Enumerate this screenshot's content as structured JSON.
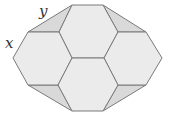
{
  "labels": {
    "x": "x",
    "y": "y"
  },
  "colors": {
    "hex_fill": "#ebebeb",
    "wedge_fill": "#d9d9d9",
    "stroke": "#7a7a7a",
    "label": "#333333"
  },
  "hexagons": [
    {
      "name": "top",
      "points": "72,5 103,5 118,32 104,58 72,58 59,32"
    },
    {
      "name": "left",
      "points": "28,32 59,32 72,58 58,85 28,85 13,58"
    },
    {
      "name": "right",
      "points": "118,32 146,32 162,58 146,85 118,85 104,58"
    },
    {
      "name": "bottom",
      "points": "72,58 104,58 118,85 103,111 72,111 58,85"
    }
  ],
  "wedges": [
    {
      "name": "top-left",
      "points": "28,32 72,5 59,32"
    },
    {
      "name": "top-right",
      "points": "103,5 146,32 118,32"
    },
    {
      "name": "bottom-left",
      "points": "28,85 58,85 72,111"
    },
    {
      "name": "bottom-right",
      "points": "118,85 146,85 103,111"
    }
  ]
}
